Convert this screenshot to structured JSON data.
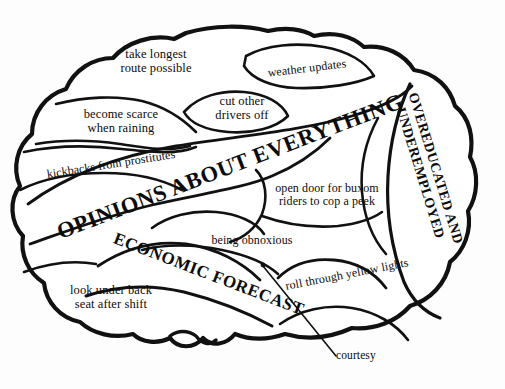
{
  "figure": {
    "type": "labeled-diagram",
    "ink_color": "#111111",
    "background_color": "#fdfdfd"
  },
  "regions": [
    {
      "id": "take-longest-route",
      "label": "take longest\nroute possible",
      "style": "lowercase"
    },
    {
      "id": "weather-updates",
      "label": "weather updates",
      "style": "lowercase"
    },
    {
      "id": "cut-other-drivers",
      "label": "cut other\ndrivers off",
      "style": "lowercase"
    },
    {
      "id": "become-scarce",
      "label": "become scarce\nwhen raining",
      "style": "lowercase"
    },
    {
      "id": "kickbacks",
      "label": "kickbacks from prostitutes",
      "style": "lowercase"
    },
    {
      "id": "opinions",
      "label": "OPINIONS ABOUT EVERYTHING",
      "style": "major-caps"
    },
    {
      "id": "overeducated",
      "label": "OVEREDUCATED AND\nUNDEREMPLOYED",
      "style": "major-caps"
    },
    {
      "id": "open-door",
      "label": "open door for buxom\nriders to cop a peek",
      "style": "lowercase"
    },
    {
      "id": "being-obnoxious",
      "label": "being obnoxious",
      "style": "lowercase"
    },
    {
      "id": "economic-forecast",
      "label": "ECONOMIC FORECAST",
      "style": "major-caps"
    },
    {
      "id": "look-under-seat",
      "label": "look under back\nseat after shift",
      "style": "lowercase"
    },
    {
      "id": "roll-through",
      "label": "roll through yellow lights",
      "style": "lowercase"
    }
  ],
  "callout": {
    "label": "courtesy",
    "leader": "line from dot inside brain down-right to label"
  }
}
